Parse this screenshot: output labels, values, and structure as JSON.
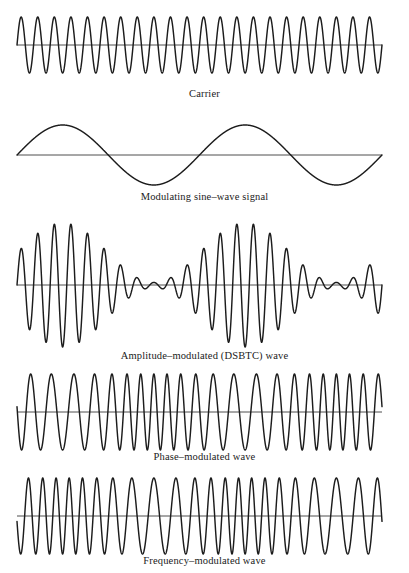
{
  "figure": {
    "background_color": "#ffffff",
    "ink_color": "#1c1c1c",
    "axis_color": "#3a3a3a"
  },
  "chart_data": {
    "type": "line",
    "title": "",
    "subtitle": "",
    "xlabel": "",
    "ylabel": "",
    "grid": false,
    "legend_position": "none",
    "axis_ranges": {
      "x": [
        0,
        1
      ],
      "y": [
        -1,
        1
      ]
    },
    "shared_x_domain": [
      0,
      1
    ],
    "carrier_cycles": 22,
    "modulating_cycles": 2,
    "panels": [
      {
        "id": "carrier",
        "label": "Carrier",
        "waveform": "constant-amplitude sinusoid",
        "formula": "y = A*sin(2*pi*fc*t)",
        "amplitude": 1.0,
        "cycles": 22,
        "amplitude_px": 28,
        "baseline_y_px": 45,
        "x_start_px": 17,
        "x_end_px": 382
      },
      {
        "id": "modulating-sine-wave-signal",
        "label": "Modulating sine–wave signal",
        "waveform": "low-frequency sinusoid",
        "formula": "y = Am*sin(2*pi*fm*t)",
        "amplitude": 1.0,
        "cycles": 2,
        "amplitude_px": 30,
        "baseline_y_px": 155,
        "x_start_px": 17,
        "x_end_px": 382
      },
      {
        "id": "amplitude-modulated-dsbtc-wave",
        "label": "Amplitude–modulated (DSBTC) wave",
        "waveform": "carrier with sinusoidal envelope",
        "formula": "y = A*(1 + m*sin(2*pi*fm*t))*sin(2*pi*fc*t)",
        "modulation_index": 0.92,
        "cycles": 22,
        "envelope_cycles": 2,
        "amplitude_px": 62,
        "baseline_y_px": 285,
        "x_start_px": 17,
        "x_end_px": 382,
        "envelope_minima_x_px": [
          155,
          330
        ]
      },
      {
        "id": "phase-modulated-wave",
        "label": "Phase–modulated wave",
        "waveform": "constant amplitude, phase deviation",
        "formula": "y = A*sin(2*pi*fc*t + beta*cos(2*pi*fm*t))",
        "phase_deviation": 3.0,
        "cycles": 22,
        "amplitude_px": 38,
        "baseline_y_px": 412,
        "x_start_px": 17,
        "x_end_px": 382,
        "compression_zones_x_px": [
          17,
          195,
          375
        ]
      },
      {
        "id": "frequency-modulated-wave",
        "label": "Frequency–modulated wave",
        "waveform": "constant amplitude, frequency deviation",
        "formula": "y = A*sin(2*pi*fc*t - beta*cos(2*pi*fm*t))",
        "frequency_deviation": 3.0,
        "cycles": 22,
        "amplitude_px": 38,
        "baseline_y_px": 516,
        "x_start_px": 17,
        "x_end_px": 382,
        "compression_zones_x_px": [
          155,
          330
        ]
      }
    ]
  }
}
